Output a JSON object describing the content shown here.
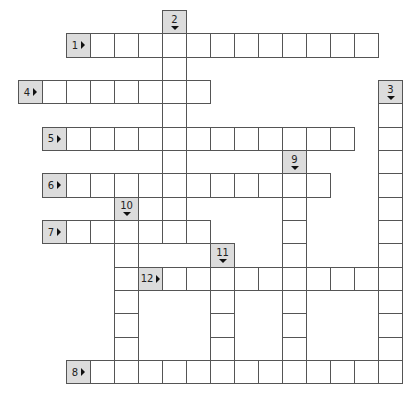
{
  "puzzle": {
    "grid": {
      "origin_x": 18,
      "origin_y": 10,
      "cell_w": 24,
      "cell_h": 23.33,
      "cols": 16,
      "rows": 16
    },
    "colors": {
      "clue_bg": "#dcdcdc",
      "cell_bg": "#ffffff",
      "border": "#555555"
    },
    "across": [
      {
        "number": "1",
        "row": 1,
        "col": 2,
        "length": 12
      },
      {
        "number": "4",
        "row": 3,
        "col": 0,
        "length": 7
      },
      {
        "number": "5",
        "row": 5,
        "col": 1,
        "length": 12
      },
      {
        "number": "6",
        "row": 7,
        "col": 1,
        "length": 11
      },
      {
        "number": "7",
        "row": 9,
        "col": 1,
        "length": 6
      },
      {
        "number": "12",
        "row": 11,
        "col": 5,
        "length": 10
      },
      {
        "number": "8",
        "row": 15,
        "col": 2,
        "length": 13
      }
    ],
    "down": [
      {
        "number": "2",
        "row": 0,
        "col": 6,
        "length": 9
      },
      {
        "number": "3",
        "row": 3,
        "col": 15,
        "length": 12
      },
      {
        "number": "9",
        "row": 6,
        "col": 11,
        "length": 9
      },
      {
        "number": "10",
        "row": 8,
        "col": 4,
        "length": 7
      },
      {
        "number": "11",
        "row": 10,
        "col": 8,
        "length": 5
      }
    ]
  }
}
